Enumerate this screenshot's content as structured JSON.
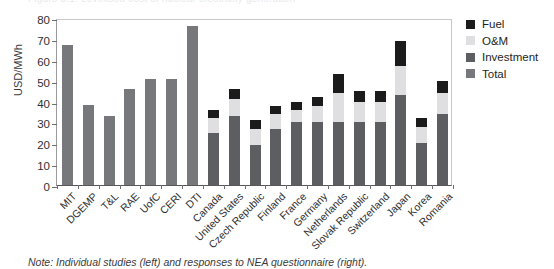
{
  "figure": {
    "title_remnant": "Figure 3.1: Levelised cost of nuclear electricity generation",
    "note": "Note: Individual studies (left) and responses to NEA questionnaire (right)."
  },
  "chart_data": {
    "type": "bar",
    "title": "",
    "xlabel": "",
    "ylabel": "USD/MWh",
    "ylim": [
      0,
      80
    ],
    "yticks": [
      0,
      10,
      20,
      30,
      40,
      50,
      60,
      70,
      80
    ],
    "grid": false,
    "legend_position": "right",
    "stacked": true,
    "categories": [
      "MIT",
      "DGEMP",
      "T&L",
      "RAE",
      "UofC",
      "CERI",
      "DTI",
      "Canada",
      "United States",
      "Czech Republic",
      "Finland",
      "France",
      "Germany",
      "Netherlands",
      "Slovak Republic",
      "Switzerland",
      "Japan",
      "Korea",
      "Romania"
    ],
    "series": [
      {
        "name": "Total",
        "color": "#77787b",
        "values": [
          67,
          38.5,
          33,
          46,
          51,
          51,
          76,
          null,
          null,
          null,
          null,
          null,
          null,
          null,
          null,
          null,
          null,
          null,
          null
        ]
      },
      {
        "name": "Investment",
        "color": "#5d5e61",
        "values": [
          null,
          null,
          null,
          null,
          null,
          null,
          null,
          25,
          33,
          19,
          27,
          30,
          30,
          30,
          30,
          30,
          43,
          20,
          34
        ]
      },
      {
        "name": "O&M",
        "color": "#dfdfe1",
        "values": [
          null,
          null,
          null,
          null,
          null,
          null,
          null,
          7,
          8,
          8,
          7,
          6,
          8,
          14,
          10,
          10,
          14,
          8,
          10
        ]
      },
      {
        "name": "Fuel",
        "color": "#1b1b1b",
        "values": [
          null,
          null,
          null,
          null,
          null,
          null,
          null,
          4,
          5,
          4,
          4,
          4,
          4,
          9,
          5,
          5,
          12,
          4,
          6
        ]
      }
    ],
    "totals": [
      67,
      38.5,
      33,
      46,
      51,
      51,
      76,
      36,
      46,
      31,
      38,
      40,
      42,
      53,
      45,
      45,
      69,
      32,
      50
    ]
  },
  "legend": {
    "items": [
      {
        "label": "Fuel",
        "color": "#1b1b1b",
        "swatch": "fuel"
      },
      {
        "label": "O&M",
        "color": "#dfdfe1",
        "swatch": "om"
      },
      {
        "label": "Investment",
        "color": "#5d5e61",
        "swatch": "investment"
      },
      {
        "label": "Total",
        "color": "#77787b",
        "swatch": "total"
      }
    ]
  }
}
